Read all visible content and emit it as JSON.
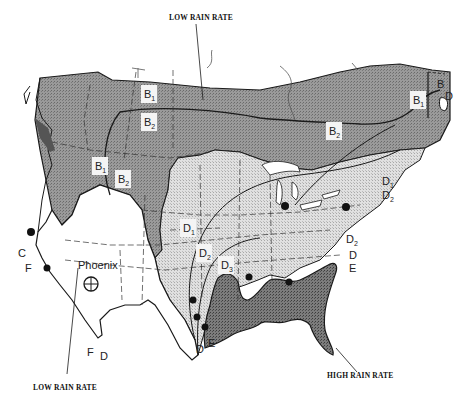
{
  "figure": {
    "type": "rain-climate-region-map",
    "region": "Continental United States and southern Canada",
    "colors": {
      "region_B": "#8c8c8c",
      "region_D": "#d2d2d2",
      "region_E": "#6e6e6e",
      "region_F": "#ffffff",
      "outline": "#1a1a1a"
    }
  },
  "callouts": {
    "top": "LOW RAIN RATE",
    "bottom_left": "LOW RAIN RATE",
    "bottom_right": "HIGH RAIN RATE"
  },
  "zones": [
    {
      "id": "B1",
      "letter": "B",
      "sub": "1"
    },
    {
      "id": "B2",
      "letter": "B",
      "sub": "2"
    },
    {
      "id": "B1w",
      "letter": "B",
      "sub": "1"
    },
    {
      "id": "B2w",
      "letter": "B",
      "sub": "2"
    },
    {
      "id": "B2e",
      "letter": "B",
      "sub": "2"
    },
    {
      "id": "B1e",
      "letter": "B",
      "sub": "1"
    },
    {
      "id": "Be",
      "letter": "B",
      "sub": ""
    },
    {
      "id": "D1",
      "letter": "D",
      "sub": "1"
    },
    {
      "id": "D2",
      "letter": "D",
      "sub": "2"
    },
    {
      "id": "D3",
      "letter": "D",
      "sub": "3"
    }
  ],
  "boundary_labels": {
    "east_D1": {
      "letter": "D",
      "sub": "1"
    },
    "east_D2": {
      "letter": "D",
      "sub": "2"
    },
    "east_D2b": {
      "letter": "D",
      "sub": "2"
    },
    "east_D": {
      "letter": "D",
      "sub": ""
    },
    "east_E": {
      "letter": "E",
      "sub": ""
    },
    "ne_D": {
      "letter": "D",
      "sub": ""
    },
    "west_C": {
      "letter": "C",
      "sub": ""
    },
    "west_F": {
      "letter": "F",
      "sub": ""
    },
    "sw_F": {
      "letter": "F",
      "sub": ""
    },
    "sw_D": {
      "letter": "D",
      "sub": ""
    },
    "gulf_D": {
      "letter": "D",
      "sub": ""
    },
    "gulf_E": {
      "letter": "E",
      "sub": ""
    }
  },
  "cities": {
    "phoenix_label": "Phoenix"
  },
  "station_count": 10
}
